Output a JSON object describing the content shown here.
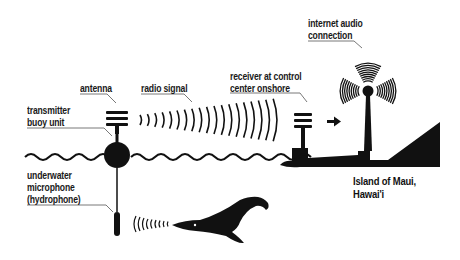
{
  "diagram": {
    "colors": {
      "ink": "#111111",
      "background": "#ffffff",
      "leader": "#555555"
    },
    "labels": {
      "antenna": "antenna",
      "radio_signal": "radio signal",
      "transmitter": [
        "transmitter",
        "buoy unit"
      ],
      "hydrophone": [
        "underwater",
        "microphone",
        "(hydrophone)"
      ],
      "receiver": [
        "receiver at control",
        "center onshore"
      ],
      "internet": [
        "internet audio",
        "connection"
      ],
      "island": [
        "Island of Maui,",
        "Hawai'i"
      ]
    },
    "icons": [
      "buoy-icon",
      "antenna-icon",
      "radio-waves-icon",
      "hydrophone-icon",
      "sound-waves-icon",
      "whale-icon",
      "receiver-antenna-icon",
      "arrow-right-icon",
      "broadcast-tower-icon",
      "island-silhouette-icon",
      "sea-waves-icon"
    ]
  }
}
